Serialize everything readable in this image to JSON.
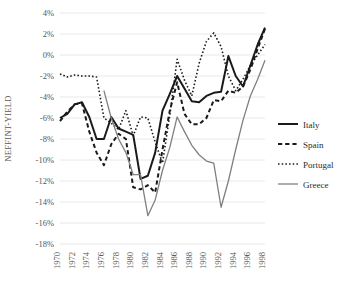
{
  "chart_data": {
    "type": "line",
    "title": "",
    "xlabel": "",
    "ylabel": "NEFFINT-YIELD",
    "ylim": [
      -18,
      4
    ],
    "xlim": [
      1970,
      1998
    ],
    "ytick_labels": [
      "4%",
      "2%",
      "0%",
      "-2%",
      "-4%",
      "-6%",
      "-8%",
      "-10%",
      "-12%",
      "-14%",
      "-16%",
      "-18%"
    ],
    "ytick_values": [
      4,
      2,
      0,
      -2,
      -4,
      -6,
      -8,
      -10,
      -12,
      -14,
      -16,
      -18
    ],
    "xtick_labels": [
      "1970",
      "1972",
      "1974",
      "1976",
      "1978",
      "1980",
      "1982",
      "1984",
      "1986",
      "1988",
      "1990",
      "1992",
      "1994",
      "1996",
      "1998"
    ],
    "xtick_values": [
      1970,
      1972,
      1974,
      1976,
      1978,
      1980,
      1982,
      1984,
      1986,
      1988,
      1990,
      1992,
      1994,
      1996,
      1998
    ],
    "grid": true,
    "legend_position": "right",
    "x": [
      1970,
      1971,
      1972,
      1973,
      1974,
      1975,
      1976,
      1977,
      1978,
      1979,
      1980,
      1981,
      1982,
      1983,
      1984,
      1985,
      1986,
      1987,
      1988,
      1989,
      1990,
      1991,
      1992,
      1993,
      1994,
      1995,
      1996,
      1997,
      1998
    ],
    "series": [
      {
        "name": "Italy",
        "style": "solid",
        "color": "#1a1a1a",
        "width": 2.0,
        "values": [
          -6.0,
          -5.6,
          -4.7,
          -4.5,
          -5.9,
          -8.0,
          -8.0,
          -5.9,
          -7.0,
          -7.3,
          -7.6,
          -11.8,
          -11.5,
          -9.3,
          -5.3,
          -3.7,
          -2.0,
          -3.2,
          -4.4,
          -4.5,
          -3.9,
          -3.6,
          -3.5,
          -0.1,
          -2.0,
          -3.0,
          -1.0,
          1.0,
          2.6
        ]
      },
      {
        "name": "Spain",
        "style": "dashed",
        "color": "#1a1a1a",
        "width": 2.0,
        "values": [
          -6.3,
          -5.4,
          -4.7,
          -4.6,
          -7.3,
          -9.3,
          -10.5,
          -8.5,
          -7.5,
          -8.0,
          -12.6,
          -12.8,
          -12.4,
          -13.1,
          -9.0,
          -5.3,
          -2.6,
          -5.6,
          -6.6,
          -6.6,
          -6.0,
          -4.3,
          -4.4,
          -3.4,
          -3.6,
          -3.0,
          -1.4,
          0.6,
          2.5
        ]
      },
      {
        "name": "Portugal",
        "style": "dotted",
        "color": "#1a1a1a",
        "width": 1.6,
        "values": [
          -1.8,
          -2.1,
          -1.9,
          -2.0,
          -2.0,
          -2.1,
          -6.0,
          -6.5,
          -7.1,
          -5.3,
          -7.7,
          -5.9,
          -6.0,
          -8.3,
          -10.3,
          -5.7,
          -0.4,
          -2.4,
          -3.9,
          -0.8,
          1.3,
          2.1,
          0.8,
          -2.0,
          -3.4,
          -2.3,
          -1.0,
          0.0,
          1.0
        ]
      },
      {
        "name": "Greece",
        "style": "solid",
        "color": "#808080",
        "width": 1.3,
        "values": [
          null,
          null,
          null,
          null,
          null,
          null,
          -3.4,
          -6.0,
          -8.0,
          -9.3,
          -11.4,
          -11.4,
          -15.3,
          -13.8,
          -11.0,
          -8.8,
          -5.9,
          -7.3,
          -8.6,
          -9.5,
          -10.1,
          -10.3,
          -14.5,
          -12.0,
          -9.0,
          -6.2,
          -3.9,
          -2.3,
          -0.5
        ]
      }
    ]
  },
  "legend": {
    "items": [
      {
        "label": "Italy"
      },
      {
        "label": "Spain"
      },
      {
        "label": "Portugal"
      },
      {
        "label": "Greece"
      }
    ]
  }
}
